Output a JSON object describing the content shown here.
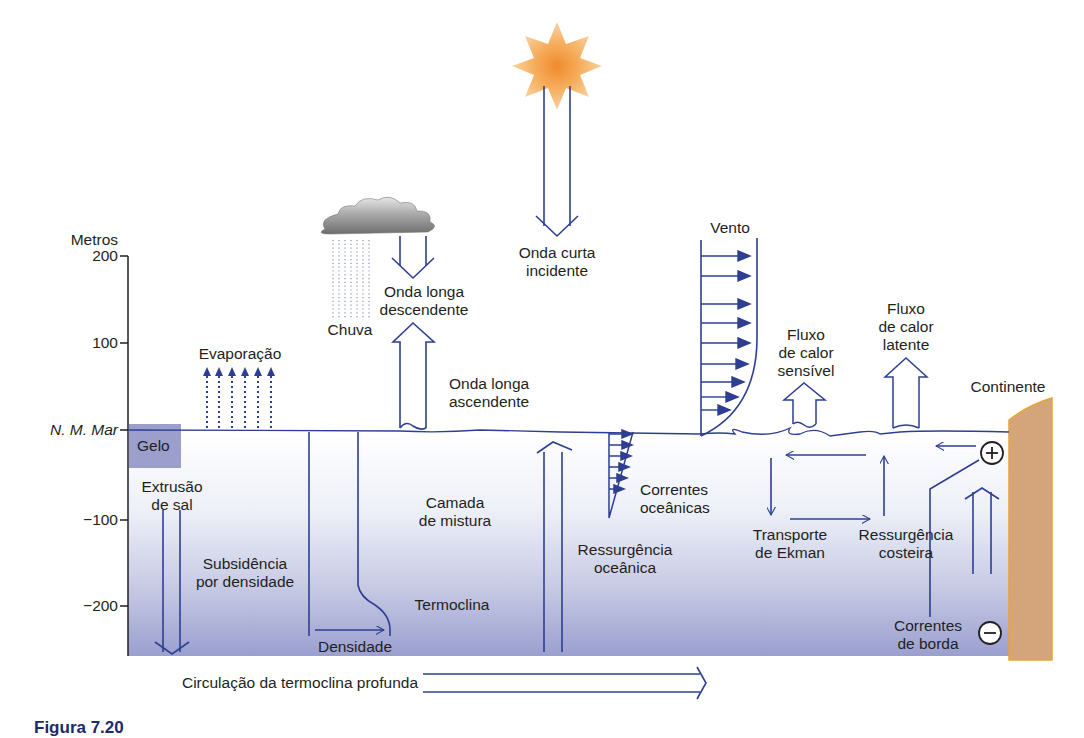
{
  "diagram": {
    "type": "ocean-atmosphere-processes",
    "colors": {
      "arrow": "#2e3f92",
      "ocean_top": "#ffffff",
      "ocean_bottom": "#9a9fcf",
      "ice": "#9c9fcc",
      "continent": "#d4a47a",
      "continent_edge": "#e5a630",
      "sun": "#f7b25a",
      "cloud": "#8a8a8a",
      "text": "#231f20"
    },
    "axis": {
      "title": "Metros",
      "ticks": [
        "200",
        "100",
        "N. M. Mar",
        "−100",
        "−200"
      ]
    },
    "labels": {
      "gelo": "Gelo",
      "extrusao": [
        "Extrusão",
        "de sal"
      ],
      "subsidencia": [
        "Subsidência",
        "por densidade"
      ],
      "densidade": "Densidade",
      "camada": [
        "Camada",
        "de mistura"
      ],
      "termoclina": "Termoclina",
      "evaporacao": "Evaporação",
      "chuva": "Chuva",
      "onda_longa_desc": [
        "Onda longa",
        "descendente"
      ],
      "onda_longa_asc": [
        "Onda longa",
        "ascendente"
      ],
      "onda_curta": [
        "Onda curta",
        "incidente"
      ],
      "ressurgencia_oceanica": [
        "Ressurgência",
        "oceânica"
      ],
      "correntes_oceanicas": [
        "Correntes",
        "oceânicas"
      ],
      "vento": "Vento",
      "fluxo_sensivel": [
        "Fluxo",
        "de calor",
        "sensível"
      ],
      "fluxo_latente": [
        "Fluxo",
        "de calor",
        "latente"
      ],
      "continente": "Continente",
      "transporte_ekman": [
        "Transporte",
        "de Ekman"
      ],
      "ressurgencia_costeira": [
        "Ressurgência",
        "costeira"
      ],
      "correntes_borda": [
        "Correntes",
        "de borda"
      ],
      "circulacao": "Circulação da termoclina profunda",
      "plus": "+",
      "minus": "−"
    },
    "caption_partial": "Figura 7.20"
  }
}
